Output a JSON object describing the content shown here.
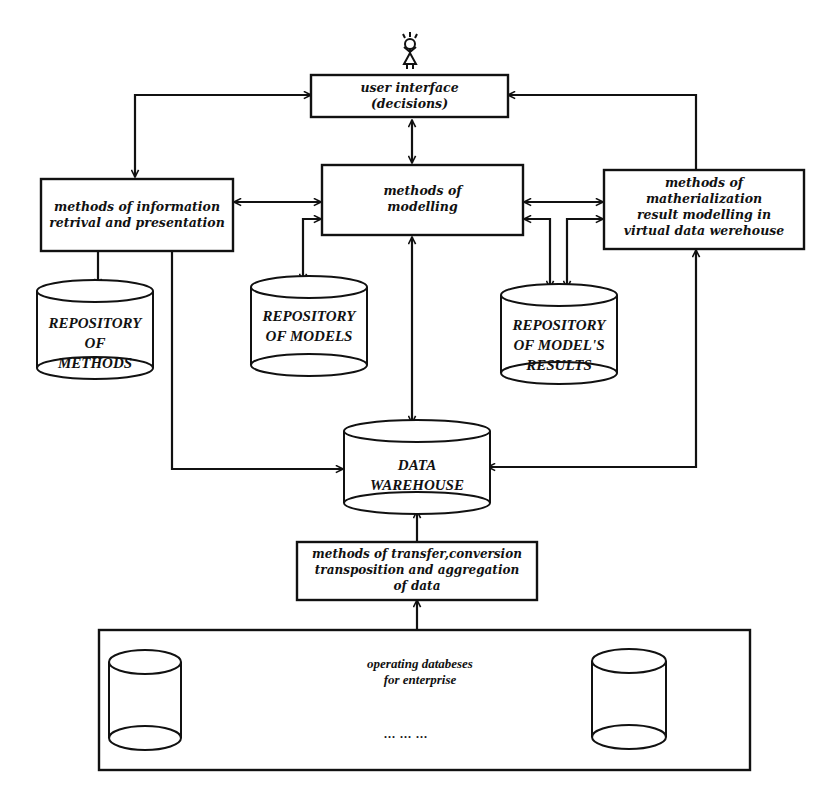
{
  "diagram": {
    "nodes": {
      "user": {
        "icon": "stick-figure-user-icon"
      },
      "user_interface": {
        "label": "user interface\n(decisions)"
      },
      "info_retrieval": {
        "label": "methods of information\nretrival and presentation"
      },
      "modelling": {
        "label": "methods of\nmodelling"
      },
      "materialization": {
        "label": "methods of\nmatherialization\nresult modelling in\nvirtual data werehouse"
      },
      "repo_methods": {
        "label": "REPOSITORY\nOF\nMETHODS"
      },
      "repo_models": {
        "label": "REPOSITORY\nOF MODELS"
      },
      "repo_results": {
        "label": "REPOSITORY\nOF MODEL'S\nRESULTS"
      },
      "data_warehouse": {
        "label": "DATA\nWAREHOUSE"
      },
      "transfer": {
        "label": "methods of transfer,conversion\ntransposition and aggregation\nof data"
      },
      "operating_dbs": {
        "label": "operating databeses\nfor enterprise",
        "ellipsis": "...   ...   ..."
      }
    },
    "edges": [
      {
        "from": "user_interface",
        "to": "info_retrieval",
        "type": "bidirectional"
      },
      {
        "from": "user_interface",
        "to": "modelling",
        "type": "bidirectional"
      },
      {
        "from": "user_interface",
        "to": "materialization",
        "type": "bidirectional"
      },
      {
        "from": "info_retrieval",
        "to": "modelling",
        "type": "bidirectional"
      },
      {
        "from": "modelling",
        "to": "materialization",
        "type": "bidirectional (two links)"
      },
      {
        "from": "info_retrieval",
        "to": "repo_methods",
        "type": "bidirectional"
      },
      {
        "from": "modelling",
        "to": "repo_models",
        "type": "bidirectional"
      },
      {
        "from": "modelling",
        "to": "repo_results",
        "type": "bidirectional"
      },
      {
        "from": "materialization",
        "to": "repo_results",
        "type": "bidirectional"
      },
      {
        "from": "info_retrieval",
        "to": "data_warehouse",
        "type": "bidirectional"
      },
      {
        "from": "modelling",
        "to": "data_warehouse",
        "type": "bidirectional"
      },
      {
        "from": "materialization",
        "to": "data_warehouse",
        "type": "bidirectional"
      },
      {
        "from": "transfer",
        "to": "data_warehouse",
        "type": "directed"
      },
      {
        "from": "operating_dbs",
        "to": "transfer",
        "type": "directed"
      }
    ]
  }
}
